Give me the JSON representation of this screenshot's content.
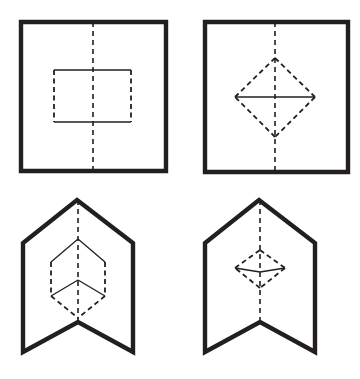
{
  "figure": {
    "canvas": {
      "width": 360,
      "height": 379
    },
    "background_color": "#ffffff",
    "stroke_color": "#231f20",
    "outer_stroke_width": 4.4,
    "inner_stroke_width": 1.3,
    "axis_stroke_width": 1.6,
    "panel_count": 4
  },
  "chart_data": {
    "type": "diagram",
    "grid": {
      "rows": 2,
      "cols": 2
    },
    "panels": [
      {
        "id": "panel-top-left",
        "position": "top-left",
        "outer_shape": "square",
        "outer_points": "21,22 166,22 166,171 21,171",
        "inner_shape": "rectangle",
        "inner_solid_edges": [
          {
            "name": "top-edge",
            "x1": 54,
            "y1": 70,
            "x2": 131,
            "y2": 70
          },
          {
            "name": "bottom-edge",
            "x1": 54,
            "y1": 122,
            "x2": 131,
            "y2": 122
          }
        ],
        "inner_dashed_edges": [
          {
            "name": "left-edge",
            "x1": 54,
            "y1": 70,
            "x2": 54,
            "y2": 122
          },
          {
            "name": "right-edge",
            "x1": 131,
            "y1": 70,
            "x2": 131,
            "y2": 122
          }
        ],
        "axis": {
          "orientation": "vertical",
          "x": 93,
          "y1": 22,
          "y2": 171,
          "style": "dashed"
        }
      },
      {
        "id": "panel-top-right",
        "position": "top-right",
        "outer_shape": "square",
        "outer_points": "205,22 348,22 348,172 205,172",
        "inner_shape": "diamond",
        "inner_points": "275,58 315,97 275,137 235,97",
        "inner_dashed_edges": [
          {
            "name": "upper-right-edge",
            "x1": 275,
            "y1": 58,
            "x2": 315,
            "y2": 97
          },
          {
            "name": "lower-right-edge",
            "x1": 315,
            "y1": 97,
            "x2": 275,
            "y2": 137
          },
          {
            "name": "lower-left-edge",
            "x1": 275,
            "y1": 137,
            "x2": 235,
            "y2": 97
          },
          {
            "name": "upper-left-edge",
            "x1": 235,
            "y1": 97,
            "x2": 275,
            "y2": 58
          }
        ],
        "inner_solid_edges": [
          {
            "name": "horizontal-diagonal",
            "x1": 235,
            "y1": 97,
            "x2": 315,
            "y2": 97
          }
        ],
        "axis": {
          "orientation": "vertical",
          "x": 275,
          "y1": 22,
          "y2": 172,
          "style": "dashed"
        }
      },
      {
        "id": "panel-bottom-left",
        "position": "bottom-left",
        "outer_shape": "banner-pentagon",
        "outer_points": "77,200 133,243 133,352 78,322 23,352 23,243",
        "inner_shape": "hexagon",
        "inner_points": "78,239 105,262 105,296 78,318 51,296 51,262",
        "inner_solid_edges": [
          {
            "name": "upper-left-edge",
            "x1": 51,
            "y1": 262,
            "x2": 78,
            "y2": 239
          },
          {
            "name": "upper-right-edge",
            "x1": 78,
            "y1": 239,
            "x2": 105,
            "y2": 262
          },
          {
            "name": "mid-left-edge",
            "x1": 51,
            "y1": 296,
            "x2": 78,
            "y2": 280
          },
          {
            "name": "mid-right-edge",
            "x1": 105,
            "y1": 296,
            "x2": 78,
            "y2": 280
          }
        ],
        "inner_dashed_edges": [
          {
            "name": "left-side-edge",
            "x1": 51,
            "y1": 262,
            "x2": 51,
            "y2": 296
          },
          {
            "name": "right-side-edge",
            "x1": 105,
            "y1": 262,
            "x2": 105,
            "y2": 296
          },
          {
            "name": "lower-left-edge",
            "x1": 51,
            "y1": 296,
            "x2": 78,
            "y2": 318
          },
          {
            "name": "lower-right-edge",
            "x1": 105,
            "y1": 296,
            "x2": 78,
            "y2": 318
          }
        ],
        "axis": {
          "orientation": "vertical",
          "x": 78,
          "y1": 200,
          "y2": 322,
          "style": "dashed"
        }
      },
      {
        "id": "panel-bottom-right",
        "position": "bottom-right",
        "outer_shape": "banner-pentagon",
        "outer_points": "259,200 315,243 315,352 260,322 205,352 205,243",
        "inner_shape": "flattened-diamond",
        "inner_points": "260,250 285,268 260,288 235,268",
        "inner_dashed_edges": [
          {
            "name": "upper-right-edge",
            "x1": 260,
            "y1": 250,
            "x2": 285,
            "y2": 268
          },
          {
            "name": "lower-right-edge",
            "x1": 285,
            "y1": 268,
            "x2": 260,
            "y2": 288
          },
          {
            "name": "lower-left-edge",
            "x1": 260,
            "y1": 288,
            "x2": 235,
            "y2": 268
          },
          {
            "name": "upper-left-edge",
            "x1": 235,
            "y1": 268,
            "x2": 260,
            "y2": 250
          }
        ],
        "inner_solid_edges": [
          {
            "name": "horizontal-diagonal-left",
            "x1": 235,
            "y1": 268,
            "x2": 260,
            "y2": 272
          },
          {
            "name": "horizontal-diagonal-right",
            "x1": 260,
            "y1": 272,
            "x2": 285,
            "y2": 268
          }
        ],
        "axis": {
          "orientation": "vertical",
          "x": 260,
          "y1": 200,
          "y2": 322,
          "style": "dashed"
        }
      }
    ],
    "legend": [],
    "annotations": []
  }
}
